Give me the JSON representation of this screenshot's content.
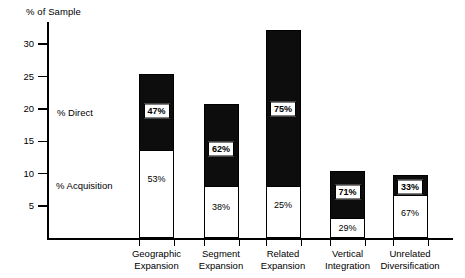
{
  "chart_data": {
    "type": "bar",
    "title": "",
    "xlabel": "",
    "ylabel": "% of Sample",
    "ylim": [
      0,
      34
    ],
    "grid": false,
    "legend_position": "inline-left",
    "stacked": true,
    "categories": [
      "Geographic Expansion",
      "Segment Expansion",
      "Related Expansion",
      "Vertical Integration",
      "Unrelated Diversification"
    ],
    "category_lines": [
      [
        "Geographic",
        "Expansion"
      ],
      [
        "Segment",
        "Expansion"
      ],
      [
        "Related",
        "Expansion"
      ],
      [
        "Vertical",
        "Integration"
      ],
      [
        "Unrelated",
        "Diversification"
      ]
    ],
    "y_ticks": [
      5,
      10,
      15,
      20,
      25,
      30
    ],
    "y_tick_labels": [
      "5",
      "10",
      "15",
      "20",
      "25",
      "30"
    ],
    "series": [
      {
        "name": "% Direct",
        "color": "#0d0d0d",
        "values": [
          11.9,
          12.9,
          24.2,
          7.4,
          3.2
        ],
        "share_labels": [
          "47%",
          "62%",
          "75%",
          "71%",
          "33%"
        ]
      },
      {
        "name": "% Acquisition",
        "color": "#ffffff",
        "values": [
          13.5,
          7.9,
          8.0,
          3.0,
          6.6
        ],
        "share_labels": [
          "53%",
          "38%",
          "25%",
          "29%",
          "67%"
        ]
      }
    ],
    "totals": [
      25.4,
      20.8,
      32.2,
      10.4,
      9.8
    ],
    "annotations": [
      {
        "text": "% Direct",
        "x_px": 57,
        "y_px": 107
      },
      {
        "text": "% Acquisition",
        "x_px": 56,
        "y_px": 180
      }
    ]
  }
}
